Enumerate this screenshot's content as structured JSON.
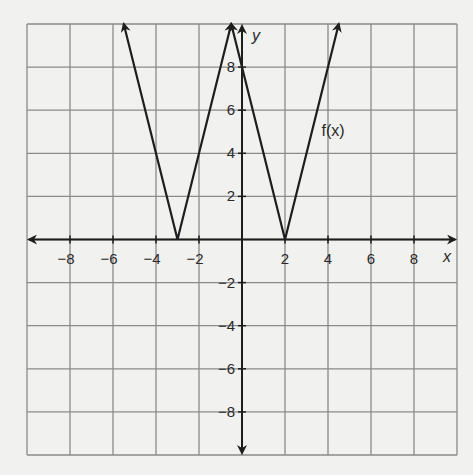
{
  "chart_data": {
    "type": "line",
    "title": "",
    "xlabel": "x",
    "ylabel": "y",
    "xlim": [
      -10,
      10
    ],
    "ylim": [
      -10,
      10
    ],
    "grid": true,
    "grid_step": 2,
    "x_ticks": [
      -8,
      -6,
      -4,
      -2,
      2,
      4,
      6,
      8
    ],
    "y_ticks": [
      8,
      6,
      4,
      2,
      -2,
      -4,
      -6,
      -8
    ],
    "x_tick_labels": [
      "−8",
      "−6",
      "−4",
      "−2",
      "2",
      "4",
      "6",
      "8"
    ],
    "y_tick_labels": [
      "8",
      "6",
      "4",
      "2",
      "−2",
      "−4",
      "−6",
      "−8"
    ],
    "legend": null,
    "annotations": [
      {
        "text": "f(x)",
        "x": 3.7,
        "y": 4.8
      }
    ],
    "series": [
      {
        "name": "f(x) branch with vertex at x = -3",
        "points": [
          [
            -5.5,
            10
          ],
          [
            -3,
            0
          ],
          [
            -0.5,
            10
          ]
        ],
        "arrows": [
          "start",
          "end"
        ]
      },
      {
        "name": "f(x) branch with vertex at x = 2",
        "points": [
          [
            -0.5,
            10
          ],
          [
            0,
            8
          ],
          [
            2,
            0
          ],
          [
            4.5,
            10
          ]
        ],
        "arrows": [
          "start",
          "end"
        ]
      }
    ],
    "key_points": [
      {
        "label": "vertex",
        "x": -3,
        "y": 0
      },
      {
        "label": "vertex",
        "x": 2,
        "y": 0
      },
      {
        "label": "y-intercept",
        "x": 0,
        "y": 8
      }
    ]
  },
  "labels": {
    "x_axis": "x",
    "y_axis": "y",
    "function": "f(x)"
  },
  "colors": {
    "background": "#f1f1ef",
    "grid": "#8a8a8a",
    "axis": "#1e1e1e",
    "curve": "#1e1e1e",
    "text": "#2a2a2a"
  }
}
